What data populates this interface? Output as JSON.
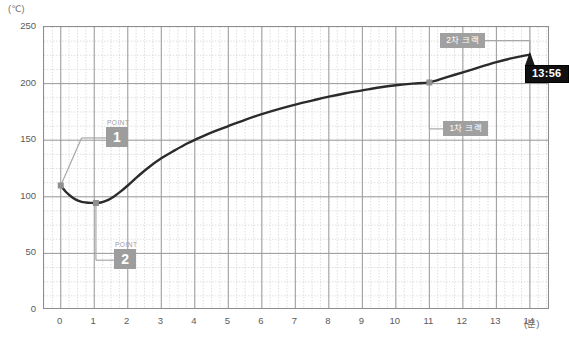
{
  "chart_data": {
    "type": "line",
    "title": "",
    "subtitle": "",
    "xlabel": "(분)",
    "ylabel": "(℃)",
    "xlim": [
      -0.5,
      14.6
    ],
    "ylim": [
      0,
      250
    ],
    "grid": true,
    "grid_major_y_step": 50,
    "grid_minor_y_step": 12.5,
    "grid_major_x_step": 1,
    "grid_minor_x_step": 0.25,
    "legend": "none",
    "x_ticks": [
      "0",
      "1",
      "2",
      "3",
      "4",
      "5",
      "6",
      "7",
      "8",
      "9",
      "10",
      "11",
      "12",
      "13",
      "14"
    ],
    "x_tick_values": [
      0,
      1,
      2,
      3,
      4,
      5,
      6,
      7,
      8,
      9,
      10,
      11,
      12,
      13,
      14
    ],
    "y_ticks": [
      "0",
      "50",
      "100",
      "150",
      "200",
      "250"
    ],
    "y_tick_values": [
      0,
      50,
      100,
      150,
      200,
      250
    ],
    "series": [
      {
        "name": "로스팅 온도",
        "color": "#2b2b2b",
        "x": [
          0.0,
          0.15,
          0.3,
          0.45,
          0.6,
          0.75,
          0.9,
          1.05,
          1.2,
          1.4,
          1.6,
          1.8,
          2.0,
          2.3,
          2.6,
          3.0,
          3.4,
          3.8,
          4.2,
          4.6,
          5.0,
          5.5,
          6.0,
          6.5,
          7.0,
          7.5,
          8.0,
          8.5,
          9.0,
          9.5,
          10.0,
          10.5,
          11.0,
          11.5,
          12.0,
          12.5,
          13.0,
          13.4,
          13.8,
          14.0
        ],
        "y": [
          110.0,
          104.5,
          100.5,
          97.5,
          95.8,
          95.0,
          94.6,
          94.5,
          95.0,
          97.0,
          100.5,
          105.0,
          110.0,
          118.0,
          125.5,
          134.0,
          141.0,
          147.5,
          153.0,
          158.0,
          162.5,
          168.0,
          173.0,
          177.5,
          181.5,
          185.0,
          188.5,
          191.5,
          194.0,
          196.5,
          198.5,
          200.0,
          201.0,
          205.5,
          210.0,
          214.5,
          219.0,
          222.0,
          224.5,
          225.5
        ]
      }
    ],
    "markers": [
      {
        "name": "start-point",
        "x": 0.0,
        "y": 110,
        "color": "#8f8f8f"
      },
      {
        "name": "turning-point",
        "x": 1.05,
        "y": 94.5,
        "color": "#8f8f8f"
      },
      {
        "name": "first-crack-point",
        "x": 11.0,
        "y": 201,
        "color": "#8f8f8f"
      },
      {
        "name": "end-point",
        "x": 14.0,
        "y": 225.5,
        "color": "#1a1a1a"
      }
    ],
    "annotations": [
      {
        "name": "point-1",
        "caption": "POINT",
        "value": "1",
        "at_x": 0.0,
        "at_y": 110
      },
      {
        "name": "point-2",
        "caption": "POINT",
        "value": "2",
        "at_x": 1.05,
        "at_y": 94.5
      },
      {
        "name": "first-crack",
        "label": "1차 크랙",
        "at_x": 11.0,
        "at_y": 201
      },
      {
        "name": "second-crack",
        "label": "2차 크랙",
        "at_x": 14.0,
        "at_y": 225.5
      },
      {
        "name": "elapsed-time",
        "label": "13:56",
        "at_x": 14.0,
        "at_y": 225.5
      }
    ]
  },
  "axes": {
    "y_unit": "(℃)",
    "x_unit": "(분)",
    "y_ticks": [
      "250",
      "200",
      "150",
      "100",
      "50",
      "0"
    ],
    "x_ticks": [
      "0",
      "1",
      "2",
      "3",
      "4",
      "5",
      "6",
      "7",
      "8",
      "9",
      "10",
      "11",
      "12",
      "13",
      "14"
    ]
  },
  "annotations": {
    "point1": {
      "caption": "POINT",
      "value": "1"
    },
    "point2": {
      "caption": "POINT",
      "value": "2"
    },
    "first_crack": {
      "label": "1차 크랙"
    },
    "second_crack": {
      "label": "2차 크랙"
    },
    "time_badge": {
      "label": "13:56"
    }
  },
  "colors": {
    "curve": "#2b2b2b",
    "annotation_box": "#9d9d9d",
    "time_badge": "#101010",
    "grid_major": "#9a9a9a",
    "grid_minor": "#cfcfcf",
    "border": "#8c8c8c"
  }
}
